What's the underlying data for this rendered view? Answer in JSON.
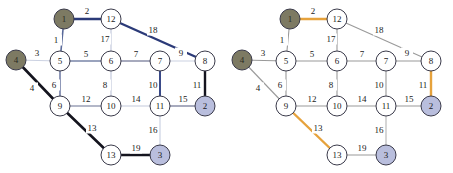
{
  "figure": {
    "type": "graph-diagram",
    "panel_count": 2,
    "background_color": "#ffffff"
  },
  "palette": {
    "node_default_fill": "#ffffff",
    "node_default_stroke": "#3a3a4a",
    "node_terminal_fill": "#7d7a63",
    "node_target_fill": "#b9bedd",
    "edge_default": "#8a8fa8",
    "edge_faint": "#ccd2e2",
    "edge_highlight_navy": "#2b3a78",
    "edge_highlight_black": "#14141e",
    "edge_highlight_orange": "#e6a23c",
    "label_color": "#1a1a1a"
  },
  "nodes": [
    {
      "id": "1",
      "label": "1",
      "x": 64,
      "y": 19,
      "r": 10,
      "style": "terminal"
    },
    {
      "id": "12",
      "label": "12",
      "x": 111,
      "y": 19,
      "r": 10,
      "style": "default"
    },
    {
      "id": "4",
      "label": "4",
      "x": 16,
      "y": 60,
      "r": 10,
      "style": "terminal"
    },
    {
      "id": "5",
      "label": "5",
      "x": 60,
      "y": 61,
      "r": 10,
      "style": "default"
    },
    {
      "id": "6",
      "label": "6",
      "x": 111,
      "y": 61,
      "r": 10,
      "style": "default"
    },
    {
      "id": "7",
      "label": "7",
      "x": 160,
      "y": 61,
      "r": 10,
      "style": "default"
    },
    {
      "id": "8",
      "label": "8",
      "x": 205,
      "y": 61,
      "r": 10,
      "style": "default"
    },
    {
      "id": "9",
      "label": "9",
      "x": 60,
      "y": 106,
      "r": 10,
      "style": "default"
    },
    {
      "id": "10",
      "label": "10",
      "x": 111,
      "y": 106,
      "r": 10,
      "style": "default"
    },
    {
      "id": "11",
      "label": "11",
      "x": 160,
      "y": 106,
      "r": 10,
      "style": "default"
    },
    {
      "id": "2",
      "label": "2",
      "x": 205,
      "y": 106,
      "r": 10,
      "style": "target"
    },
    {
      "id": "13",
      "label": "13",
      "x": 111,
      "y": 155,
      "r": 10,
      "style": "default"
    },
    {
      "id": "3",
      "label": "3",
      "x": 160,
      "y": 155,
      "r": 10,
      "style": "target"
    }
  ],
  "edges": [
    {
      "id": "e1",
      "label": "1",
      "from": "1",
      "to": "5",
      "lx": 56,
      "ly": 40
    },
    {
      "id": "e2",
      "label": "2",
      "from": "1",
      "to": "12",
      "lx": 87,
      "ly": 11
    },
    {
      "id": "e3",
      "label": "3",
      "from": "4",
      "to": "5",
      "lx": 37,
      "ly": 53
    },
    {
      "id": "e4",
      "label": "4",
      "from": "4",
      "to": "9",
      "lx": 32,
      "ly": 88
    },
    {
      "id": "e5",
      "label": "5",
      "from": "5",
      "to": "6",
      "lx": 86,
      "ly": 54
    },
    {
      "id": "e6",
      "label": "6",
      "from": "5",
      "to": "9",
      "lx": 54,
      "ly": 85
    },
    {
      "id": "e7",
      "label": "7",
      "from": "6",
      "to": "7",
      "lx": 136,
      "ly": 54
    },
    {
      "id": "e8",
      "label": "8",
      "from": "6",
      "to": "10",
      "lx": 105,
      "ly": 85
    },
    {
      "id": "e9",
      "label": "9",
      "from": "7",
      "to": "8",
      "lx": 181,
      "ly": 53
    },
    {
      "id": "e10",
      "label": "10",
      "from": "7",
      "to": "11",
      "lx": 153,
      "ly": 85
    },
    {
      "id": "e11",
      "label": "11",
      "from": "8",
      "to": "2",
      "lx": 197,
      "ly": 85
    },
    {
      "id": "e12",
      "label": "12",
      "from": "9",
      "to": "10",
      "lx": 86,
      "ly": 99
    },
    {
      "id": "e13",
      "label": "13",
      "from": "9",
      "to": "13",
      "lx": 92,
      "ly": 128
    },
    {
      "id": "e14",
      "label": "14",
      "from": "10",
      "to": "11",
      "lx": 136,
      "ly": 99
    },
    {
      "id": "e15",
      "label": "15",
      "from": "11",
      "to": "2",
      "lx": 183,
      "ly": 99
    },
    {
      "id": "e16",
      "label": "16",
      "from": "11",
      "to": "3",
      "lx": 153,
      "ly": 130
    },
    {
      "id": "e17",
      "label": "17",
      "from": "12",
      "to": "6",
      "lx": 105,
      "ly": 39
    },
    {
      "id": "e18",
      "label": "18",
      "from": "12",
      "to": "8",
      "lx": 153,
      "ly": 30
    },
    {
      "id": "e19",
      "label": "19",
      "from": "13",
      "to": "3",
      "lx": 136,
      "ly": 148
    }
  ],
  "panels": [
    {
      "id": "left",
      "name": "left-graph-panel",
      "edge_styles": {
        "e1": {
          "color": "#5a6a9a",
          "width": 1.6
        },
        "e2": {
          "color": "#2b3a78",
          "width": 2.4
        },
        "e3": {
          "color": "#ccd2e2",
          "width": 1.2
        },
        "e4": {
          "color": "#14141e",
          "width": 2.6
        },
        "e5": {
          "color": "#7a85a8",
          "width": 1.4
        },
        "e6": {
          "color": "#6a76a0",
          "width": 1.5
        },
        "e7": {
          "color": "#8a8fa8",
          "width": 1.3
        },
        "e8": {
          "color": "#c3c9dc",
          "width": 1.2
        },
        "e9": {
          "color": "#ccd2e2",
          "width": 1.2
        },
        "e10": {
          "color": "#3a4a88",
          "width": 2.0
        },
        "e11": {
          "color": "#14141e",
          "width": 2.4
        },
        "e12": {
          "color": "#9aa0b6",
          "width": 1.3
        },
        "e13": {
          "color": "#14141e",
          "width": 2.6
        },
        "e14": {
          "color": "#c3c9dc",
          "width": 1.2
        },
        "e15": {
          "color": "#8a8fa8",
          "width": 1.3
        },
        "e16": {
          "color": "#ccd2e2",
          "width": 1.2
        },
        "e17": {
          "color": "#c3c9dc",
          "width": 1.2
        },
        "e18": {
          "color": "#2b3a78",
          "width": 2.4
        },
        "e19": {
          "color": "#14141e",
          "width": 2.6
        }
      }
    },
    {
      "id": "right",
      "name": "right-graph-panel",
      "edge_styles": {
        "e1": {
          "color": "#9a9a9a",
          "width": 1.1
        },
        "e2": {
          "color": "#e6a23c",
          "width": 2.4
        },
        "e3": {
          "color": "#9a9a9a",
          "width": 1.1
        },
        "e4": {
          "color": "#9a9a9a",
          "width": 1.1
        },
        "e5": {
          "color": "#9a9a9a",
          "width": 1.1
        },
        "e6": {
          "color": "#9a9a9a",
          "width": 1.1
        },
        "e7": {
          "color": "#9a9a9a",
          "width": 1.1
        },
        "e8": {
          "color": "#9a9a9a",
          "width": 1.1
        },
        "e9": {
          "color": "#9a9a9a",
          "width": 1.1
        },
        "e10": {
          "color": "#9a9a9a",
          "width": 1.1
        },
        "e11": {
          "color": "#e6a23c",
          "width": 2.4
        },
        "e12": {
          "color": "#9a9a9a",
          "width": 1.1
        },
        "e13": {
          "color": "#e6a23c",
          "width": 2.4
        },
        "e14": {
          "color": "#9a9a9a",
          "width": 1.1
        },
        "e15": {
          "color": "#9a9a9a",
          "width": 1.1
        },
        "e16": {
          "color": "#b5b5b5",
          "width": 1.1
        },
        "e17": {
          "color": "#9a9a9a",
          "width": 1.1
        },
        "e18": {
          "color": "#9a9a9a",
          "width": 1.1
        },
        "e19": {
          "color": "#9a9a9a",
          "width": 1.1
        }
      }
    }
  ]
}
